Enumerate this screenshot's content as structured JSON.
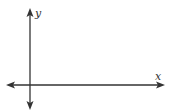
{
  "diagram": {
    "type": "coordinate-axes",
    "x_axis": {
      "label": "x",
      "direction": "both-arrows"
    },
    "y_axis": {
      "label": "y",
      "direction": "both-arrows"
    },
    "colors": {
      "axis": "#333333",
      "background": "#ffffff"
    }
  }
}
